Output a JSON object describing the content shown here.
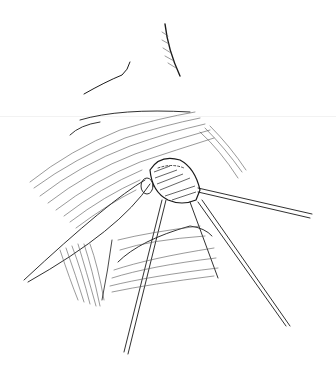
{
  "illustration": {
    "subject": "surgical line drawing",
    "style": "pen-and-ink hatching",
    "colors": {
      "ink": "#1a1a1a",
      "hatch": "#555555",
      "background": "#ffffff"
    },
    "elements": [
      "brow-stroke-left",
      "brow-stroke-right",
      "tissue-mass-upper",
      "sutured-organ",
      "retraction-sutures",
      "lower-tissue-flap",
      "instrument-shafts"
    ]
  }
}
